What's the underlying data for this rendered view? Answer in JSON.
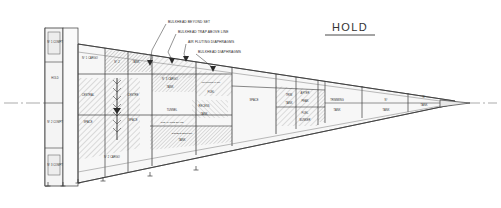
{
  "drawing": {
    "title": "HOLD",
    "type": "longitudinal-section",
    "subject": "ship hold compartment arrangement",
    "paper_color": "#ffffff",
    "ink_color": "#2b2b2b",
    "hatch_color": "#8c8c8c",
    "fill_color": "#f2f2f2"
  },
  "annotations": [
    {
      "id": "a1",
      "text": "BULKHEAD BEYOND SET",
      "x": 168,
      "y": 22,
      "leader_to_x": 150,
      "leader_to_y": 64
    },
    {
      "id": "a2",
      "text": "BULKHEAD TRAP ABOVE LINE",
      "x": 178,
      "y": 32,
      "leader_to_x": 173,
      "leader_to_y": 62
    },
    {
      "id": "a3",
      "text": "AIR FLUTING DIAPHRAGMS",
      "x": 188,
      "y": 42,
      "leader_to_x": 186,
      "leader_to_y": 60
    },
    {
      "id": "a4",
      "text": "BULKHEAD DIAPHRAGMS",
      "x": 198,
      "y": 52,
      "leader_to_x": 214,
      "leader_to_y": 70
    }
  ],
  "compartments": [
    {
      "id": "c1",
      "label": "N° 1 COMPT",
      "x": 55,
      "y": 42,
      "hatched": false
    },
    {
      "id": "c2",
      "label": "HOLD",
      "x": 55,
      "y": 78,
      "hatched": false
    },
    {
      "id": "c3",
      "label": "N° 2 COMPT",
      "x": 55,
      "y": 122,
      "hatched": false
    },
    {
      "id": "c4",
      "label": "N° 3 COMPT",
      "x": 55,
      "y": 165,
      "hatched": false
    },
    {
      "id": "c5",
      "label": "N° 1 CARGO",
      "x": 90,
      "y": 58,
      "hatched": false
    },
    {
      "id": "c6",
      "label": "CENTRAL",
      "x": 88,
      "y": 95,
      "hatched": true
    },
    {
      "id": "c7",
      "label": "SPACE",
      "x": 88,
      "y": 122,
      "hatched": false
    },
    {
      "id": "c8",
      "label": "N° 2 CARGO",
      "x": 112,
      "y": 157,
      "hatched": false
    },
    {
      "id": "c9",
      "label": "N° 2",
      "x": 117,
      "y": 62,
      "hatched": true
    },
    {
      "id": "c10",
      "label": "TANK",
      "x": 136,
      "y": 62,
      "hatched": false
    },
    {
      "id": "c11",
      "label": "CENTRE",
      "x": 133,
      "y": 95,
      "hatched": false
    },
    {
      "id": "c12",
      "label": "SPACE",
      "x": 133,
      "y": 120,
      "hatched": false
    },
    {
      "id": "c13",
      "label": "N° 3 CARGO",
      "x": 170,
      "y": 79,
      "hatched": true
    },
    {
      "id": "c14",
      "label": "TANK",
      "x": 170,
      "y": 87,
      "hatched": false
    },
    {
      "id": "c15",
      "label": "TRIMMING TANK",
      "x": 211,
      "y": 82,
      "hatched": true
    },
    {
      "id": "c16",
      "label": "FUEL",
      "x": 211,
      "y": 92,
      "hatched": false
    },
    {
      "id": "c17",
      "label": "TUNNEL",
      "x": 172,
      "y": 110,
      "hatched": false
    },
    {
      "id": "c18",
      "label": "RECESS",
      "x": 204,
      "y": 106,
      "hatched": true
    },
    {
      "id": "c19",
      "label": "TANK",
      "x": 204,
      "y": 114,
      "hatched": false
    },
    {
      "id": "c20",
      "label": "CLEARANCE SPACE",
      "x": 172,
      "y": 122,
      "hatched": true
    },
    {
      "id": "c21",
      "label": "DOUBLE BOTTOM",
      "x": 182,
      "y": 133,
      "hatched": true
    },
    {
      "id": "c22",
      "label": "TANK",
      "x": 182,
      "y": 140,
      "hatched": false
    },
    {
      "id": "c23",
      "label": "SPACE",
      "x": 254,
      "y": 100,
      "hatched": false
    },
    {
      "id": "c24",
      "label": "TRIM",
      "x": 289,
      "y": 95,
      "hatched": true
    },
    {
      "id": "c25",
      "label": "TANK",
      "x": 289,
      "y": 103,
      "hatched": false
    },
    {
      "id": "c26",
      "label": "AFTER",
      "x": 305,
      "y": 93,
      "hatched": true
    },
    {
      "id": "c27",
      "label": "PEAK",
      "x": 305,
      "y": 101,
      "hatched": false
    },
    {
      "id": "c28",
      "label": "FUEL",
      "x": 305,
      "y": 113,
      "hatched": true
    },
    {
      "id": "c29",
      "label": "BUNKER",
      "x": 305,
      "y": 120,
      "hatched": false
    },
    {
      "id": "c30",
      "label": "TRIMMING",
      "x": 337,
      "y": 100,
      "hatched": false
    },
    {
      "id": "c31",
      "label": "TANK",
      "x": 337,
      "y": 110,
      "hatched": false
    },
    {
      "id": "c32",
      "label": "N°",
      "x": 386,
      "y": 100,
      "hatched": false
    },
    {
      "id": "c33",
      "label": "TANK",
      "x": 386,
      "y": 110,
      "hatched": false
    },
    {
      "id": "c34",
      "label": "N°",
      "x": 424,
      "y": 97,
      "hatched": false
    },
    {
      "id": "c35",
      "label": "TANK",
      "x": 424,
      "y": 105,
      "hatched": false
    }
  ],
  "centerline": {
    "y": 103,
    "x_start": 4,
    "x_end": 497
  },
  "supports": [
    {
      "x": 48,
      "y": 186
    },
    {
      "x": 63,
      "y": 186
    },
    {
      "x": 78,
      "y": 183
    },
    {
      "x": 103,
      "y": 181
    },
    {
      "x": 150,
      "y": 176
    },
    {
      "x": 196,
      "y": 170
    }
  ]
}
